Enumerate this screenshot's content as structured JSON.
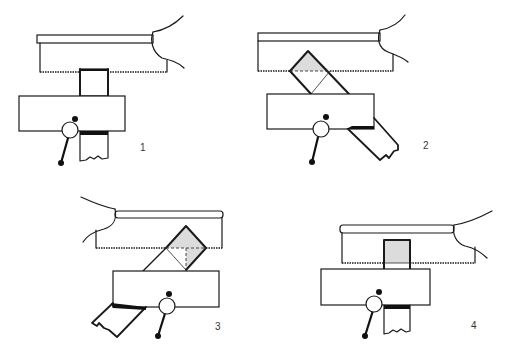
{
  "figure": {
    "panels": [
      {
        "id": 1,
        "label": "1",
        "workpiece_orientation": "upright",
        "cut_state": "starting cut, workpiece square"
      },
      {
        "id": 2,
        "label": "2",
        "workpiece_orientation": "rotated 45 degrees right",
        "cut_state": "corner cut shaded"
      },
      {
        "id": 3,
        "label": "3",
        "workpiece_orientation": "rotated 45 degrees left",
        "cut_state": "corner cut shaded with dashed guide"
      },
      {
        "id": 4,
        "label": "4",
        "workpiece_orientation": "upright",
        "cut_state": "final cut, shaded square section"
      }
    ],
    "colors": {
      "line": "#1a1a1a",
      "shade": "#dcdcdc",
      "background": "#ffffff"
    }
  }
}
